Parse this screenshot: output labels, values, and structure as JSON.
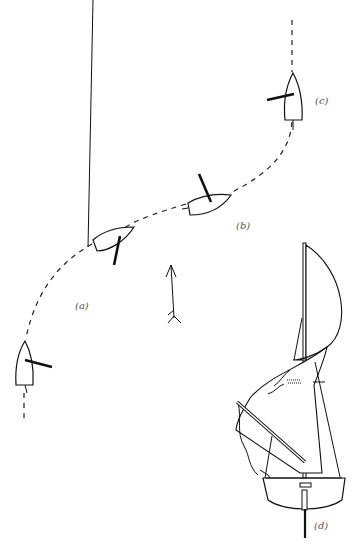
{
  "figure": {
    "title": "",
    "labels": {
      "a": "(a)",
      "b": "(b)",
      "c": "(c)",
      "d": "(d)"
    },
    "elements": [
      {
        "id": "a",
        "description": "dinghy heading right along dashed course, sail boom across hull"
      },
      {
        "id": "b",
        "description": "dinghy on curving dashed course, boom pointing up"
      },
      {
        "id": "c",
        "description": "dinghy heading up (north) on dashed course, boom to the left"
      },
      {
        "id": "d",
        "description": "sailboat illustration seen from astern with mast, billowing spinnaker, pole and jib"
      }
    ],
    "wind_arrow": {
      "direction": "up"
    },
    "colors": {
      "line": "#111111",
      "background": "#ffffff",
      "label": "#555555"
    }
  }
}
